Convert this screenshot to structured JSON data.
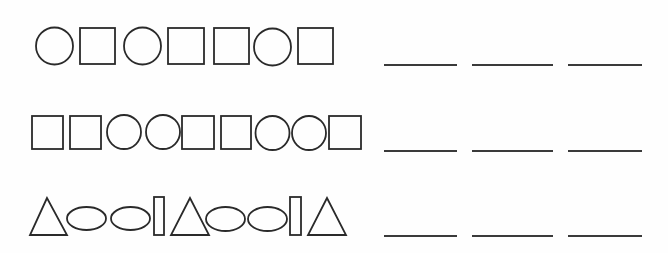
{
  "worksheet": {
    "title": "Shape pattern sequences",
    "stroke_color": "#2a2a2a",
    "blank_color": "#3a3a3a",
    "rows": [
      {
        "id": "row-1",
        "label": "Pattern row 1",
        "sequence": [
          "circle",
          "square",
          "circle",
          "square",
          "square",
          "circle",
          "square"
        ],
        "shapes": [
          {
            "type": "circle",
            "cx": 54.5,
            "cy": 46,
            "r": 18.5
          },
          {
            "type": "square",
            "x": 80,
            "y": 28,
            "w": 35,
            "h": 36
          },
          {
            "type": "circle",
            "cx": 142.5,
            "cy": 46,
            "r": 18.5
          },
          {
            "type": "square",
            "x": 168,
            "y": 28,
            "w": 36,
            "h": 36
          },
          {
            "type": "square",
            "x": 214,
            "y": 28,
            "w": 35,
            "h": 36
          },
          {
            "type": "circle",
            "cx": 272.5,
            "cy": 47,
            "r": 18.5
          },
          {
            "type": "square",
            "x": 298,
            "y": 28,
            "w": 35,
            "h": 36
          }
        ],
        "blanks": [
          {
            "x1": 384,
            "x2": 457,
            "y": 65
          },
          {
            "x1": 472,
            "x2": 553,
            "y": 65
          },
          {
            "x1": 568,
            "x2": 642,
            "y": 65
          }
        ]
      },
      {
        "id": "row-2",
        "label": "Pattern row 2",
        "sequence": [
          "square",
          "square",
          "circle",
          "circle",
          "square",
          "square",
          "circle",
          "circle",
          "square"
        ],
        "shapes": [
          {
            "type": "square",
            "x": 32,
            "y": 116,
            "w": 31,
            "h": 33
          },
          {
            "type": "square",
            "x": 70,
            "y": 116,
            "w": 31,
            "h": 33
          },
          {
            "type": "circle",
            "cx": 124,
            "cy": 132,
            "r": 17
          },
          {
            "type": "circle",
            "cx": 163,
            "cy": 132,
            "r": 17
          },
          {
            "type": "square",
            "x": 182,
            "y": 116,
            "w": 32,
            "h": 33
          },
          {
            "type": "square",
            "x": 221,
            "y": 116,
            "w": 30,
            "h": 33
          },
          {
            "type": "circle",
            "cx": 272.5,
            "cy": 133,
            "r": 17
          },
          {
            "type": "circle",
            "cx": 309,
            "cy": 133,
            "r": 17
          },
          {
            "type": "square",
            "x": 329,
            "y": 116,
            "w": 32,
            "h": 33
          }
        ],
        "blanks": [
          {
            "x1": 384,
            "x2": 457,
            "y": 151
          },
          {
            "x1": 472,
            "x2": 553,
            "y": 151
          },
          {
            "x1": 568,
            "x2": 642,
            "y": 151
          }
        ]
      },
      {
        "id": "row-3",
        "label": "Pattern row 3",
        "sequence": [
          "triangle",
          "ellipse",
          "ellipse",
          "rectangle",
          "triangle",
          "ellipse",
          "ellipse",
          "rectangle",
          "triangle"
        ],
        "shapes": [
          {
            "type": "triangle",
            "points": "47,198 30,235 67,235"
          },
          {
            "type": "ellipse",
            "cx": 86.5,
            "cy": 218.5,
            "rx": 19.5,
            "ry": 11.5
          },
          {
            "type": "ellipse",
            "cx": 130.5,
            "cy": 218.5,
            "rx": 19.5,
            "ry": 11.5
          },
          {
            "type": "rectangle",
            "x": 154,
            "y": 197,
            "w": 10,
            "h": 38
          },
          {
            "type": "triangle",
            "points": "190,198 171,235 209,235"
          },
          {
            "type": "ellipse",
            "cx": 225.5,
            "cy": 219,
            "rx": 19.5,
            "ry": 12
          },
          {
            "type": "ellipse",
            "cx": 267.5,
            "cy": 219,
            "rx": 19.5,
            "ry": 12
          },
          {
            "type": "rectangle",
            "x": 290,
            "y": 197,
            "w": 11,
            "h": 38
          },
          {
            "type": "triangle",
            "points": "327,198 308,235 346,235"
          }
        ],
        "blanks": [
          {
            "x1": 384,
            "x2": 457,
            "y": 236
          },
          {
            "x1": 472,
            "x2": 553,
            "y": 236
          },
          {
            "x1": 568,
            "x2": 642,
            "y": 236
          }
        ]
      }
    ]
  }
}
